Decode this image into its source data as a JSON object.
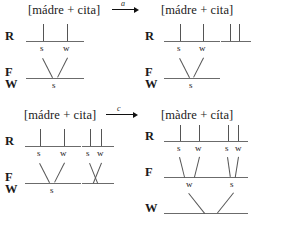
{
  "figure": {
    "kind": "metrical-grid-derivation",
    "tiers": {
      "R": "R",
      "F": "F",
      "W": "W"
    }
  },
  "panels": [
    {
      "id": "panel-1",
      "label": "[mádre + cita]",
      "tiers": [
        "R",
        "F",
        "W"
      ],
      "groups": [
        {
          "id": "g1",
          "stems": 2,
          "sw": [
            "s",
            "w"
          ],
          "foot": true,
          "foot_label": "s"
        }
      ]
    },
    {
      "id": "panel-2",
      "label": "[mádre + cita]",
      "tiers": [
        "R",
        "F",
        "W"
      ],
      "groups": [
        {
          "id": "g1",
          "stems": 2,
          "sw": [
            "s",
            "w"
          ],
          "foot": true,
          "foot_label": "s"
        },
        {
          "id": "g2",
          "stems": 2,
          "sw": [],
          "foot": false,
          "foot_label": ""
        }
      ]
    },
    {
      "id": "panel-3",
      "label": "[mádre + cita]",
      "tiers": [
        "R",
        "F",
        "W"
      ],
      "groups": [
        {
          "id": "g1",
          "stems": 2,
          "sw": [
            "s",
            "w"
          ],
          "foot": true,
          "foot_label": "s"
        },
        {
          "id": "g2",
          "stems": 2,
          "sw": [
            "s",
            "w"
          ],
          "foot": true,
          "foot_label": ""
        }
      ]
    },
    {
      "id": "panel-4",
      "label": "[màdre + cíta]",
      "tiers": [
        "R",
        "F",
        "W"
      ],
      "groups": [
        {
          "id": "g1",
          "stems": 2,
          "sw": [
            "s",
            "w"
          ],
          "foot": true,
          "foot_label": "w"
        },
        {
          "id": "g2",
          "stems": 2,
          "sw": [
            "s",
            "w"
          ],
          "foot": true,
          "foot_label": "s"
        }
      ],
      "word_tier": true
    }
  ],
  "arrows": [
    {
      "id": "arrow-a",
      "label": "a"
    },
    {
      "id": "arrow-b",
      "label": "b"
    },
    {
      "id": "arrow-c",
      "label": "c"
    }
  ],
  "colors": {
    "ink": "#1a1a1a",
    "rule": "#6b6b6b",
    "stem": "#555555",
    "background": "#ffffff"
  }
}
